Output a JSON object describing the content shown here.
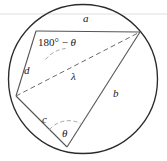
{
  "figure": {
    "labels": {
      "side_a": "a",
      "side_b": "b",
      "side_c": "c",
      "side_d": "d",
      "diagonal": "λ",
      "angle_theta": "θ",
      "angle_supplement_prefix": "180° − ",
      "angle_supplement_symbol": "θ"
    },
    "colors": {
      "circle_stroke": "#2b2b2b",
      "chord_stroke": "#4a4a4a",
      "dashed_stroke": "#6b6b6b",
      "arc_stroke": "#9a9a9a",
      "guide_line": "#d9d9d9",
      "label_color": "#202020",
      "background": "#ffffff"
    },
    "geometry": {
      "circle": {
        "cx": 83,
        "cy": 79,
        "r": 74.5
      },
      "vertices": {
        "top_left": {
          "x": 36,
          "y": 31
        },
        "top_right": {
          "x": 140,
          "y": 32
        },
        "bottom": {
          "x": 67,
          "y": 147
        },
        "left": {
          "x": 16,
          "y": 96
        }
      },
      "guide_line_y": 14
    }
  }
}
